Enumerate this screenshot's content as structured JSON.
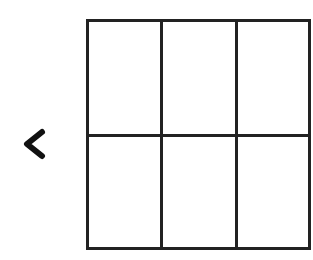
{
  "navigation": {
    "back_icon": "chevron-left-icon"
  },
  "grid": {
    "rows": 2,
    "columns": 3,
    "cells": [
      {
        "row": 0,
        "col": 0,
        "content": ""
      },
      {
        "row": 0,
        "col": 1,
        "content": ""
      },
      {
        "row": 0,
        "col": 2,
        "content": ""
      },
      {
        "row": 1,
        "col": 0,
        "content": ""
      },
      {
        "row": 1,
        "col": 1,
        "content": ""
      },
      {
        "row": 1,
        "col": 2,
        "content": ""
      }
    ],
    "line_color": "#222222"
  }
}
